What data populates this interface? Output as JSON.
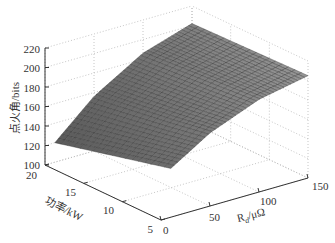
{
  "chart_data": {
    "type": "surface3d",
    "title": "",
    "xlabel": "R_d/μΩ",
    "ylabel": "功率/kW",
    "zlabel": "点火角/bits",
    "x_ticks": [
      0,
      50,
      100,
      150
    ],
    "y_ticks": [
      5,
      10,
      15,
      20
    ],
    "z_ticks": [
      100,
      120,
      140,
      160,
      180,
      200,
      220
    ],
    "xlim": [
      0,
      150
    ],
    "ylim": [
      5,
      20
    ],
    "zlim": [
      100,
      220
    ],
    "grid": true,
    "colormap": "gray",
    "surface_samples": {
      "x": [
        10,
        50,
        100,
        150
      ],
      "y": [
        5,
        10,
        15,
        20
      ],
      "z": [
        [
          150,
          175,
          195,
          205
        ],
        [
          140,
          168,
          192,
          204
        ],
        [
          130,
          162,
          189,
          203
        ],
        [
          120,
          156,
          186,
          202
        ]
      ]
    }
  },
  "labels": {
    "z_axis": "点火角/bits",
    "y_axis": "功率/kW",
    "x_axis_main": "R",
    "x_axis_sub": "d",
    "x_axis_unit": "/μΩ"
  },
  "ticks": {
    "z": [
      "100",
      "120",
      "140",
      "160",
      "180",
      "200",
      "220"
    ],
    "y": [
      "20",
      "15",
      "10",
      "5"
    ],
    "x": [
      "0",
      "50",
      "100",
      "150"
    ]
  }
}
